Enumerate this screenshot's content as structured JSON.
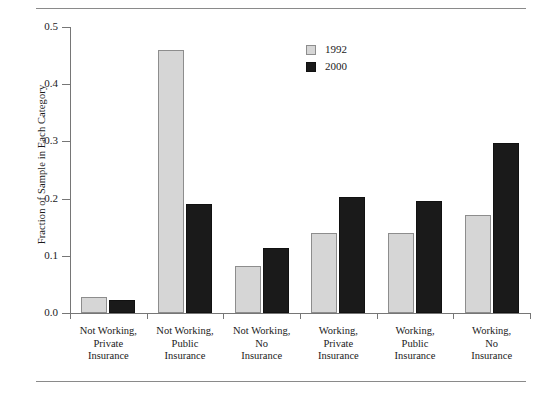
{
  "chart_data": {
    "type": "bar",
    "title": "",
    "xlabel": "",
    "ylabel": "Fraction of Sample in Each Category",
    "ylim": [
      0.0,
      0.5
    ],
    "yticks": [
      "0.0",
      "0.1",
      "0.2",
      "0.3",
      "0.4",
      "0.5"
    ],
    "ytick_values": [
      0.0,
      0.1,
      0.2,
      0.3,
      0.4,
      0.5
    ],
    "grid": false,
    "legend_position": "top-center-right",
    "categories": [
      "Not Working,\nPrivate\nInsurance",
      "Not Working,\nPublic\nInsurance",
      "Not Working,\nNo\nInsurance",
      "Working,\nPrivate\nInsurance",
      "Working,\nPublic\nInsurance",
      "Working,\nNo\nInsurance"
    ],
    "series": [
      {
        "name": "1992",
        "color": "#d6d6d6",
        "values": [
          0.028,
          0.459,
          0.082,
          0.14,
          0.14,
          0.172
        ]
      },
      {
        "name": "2000",
        "color": "#1a1a1a",
        "values": [
          0.023,
          0.191,
          0.114,
          0.203,
          0.195,
          0.297
        ]
      }
    ]
  },
  "legend": {
    "items": [
      {
        "label": "1992",
        "swatch": "light"
      },
      {
        "label": "2000",
        "swatch": "dark"
      }
    ]
  }
}
